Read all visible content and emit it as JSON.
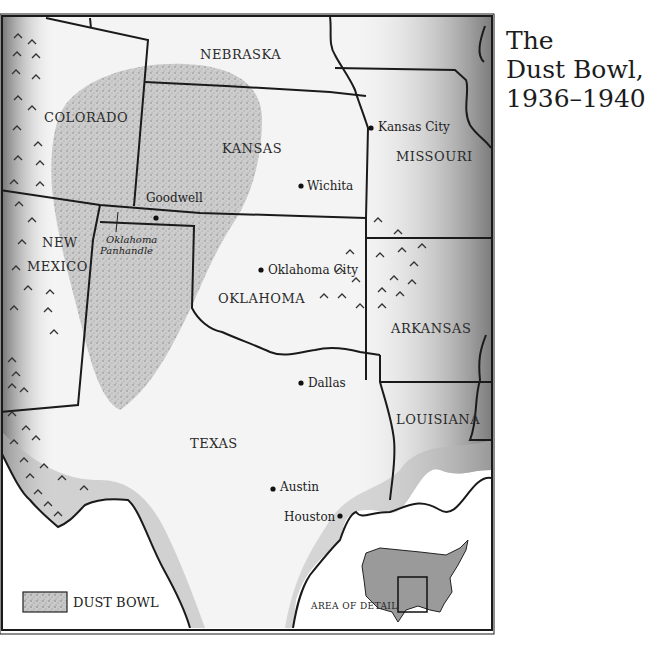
{
  "title": {
    "line1": "The",
    "line2": "Dust Bowl,",
    "line3": "1936–1940"
  },
  "states": {
    "nebraska": "NEBRASKA",
    "colorado": "COLORADO",
    "kansas": "KANSAS",
    "missouri": "MISSOURI",
    "new_mexico_1": "NEW",
    "new_mexico_2": "MEXICO",
    "oklahoma": "OKLAHOMA",
    "arkansas": "ARKANSAS",
    "texas": "TEXAS",
    "louisiana": "LOUISIANA"
  },
  "cities": {
    "kansas_city": "Kansas City",
    "wichita": "Wichita",
    "goodwell": "Goodwell",
    "oklahoma_city": "Oklahoma City",
    "dallas": "Dallas",
    "austin": "Austin",
    "houston": "Houston"
  },
  "regions": {
    "panhandle_1": "Oklahoma",
    "panhandle_2": "Panhandle"
  },
  "legend": {
    "dust_bowl": "DUST BOWL"
  },
  "inset": {
    "label": "AREA OF DETAIL"
  },
  "colors": {
    "ink": "#1a1a1a",
    "dust": "#bdbdbd",
    "shade": "#9a9a9a",
    "paper": "#fafafa"
  }
}
